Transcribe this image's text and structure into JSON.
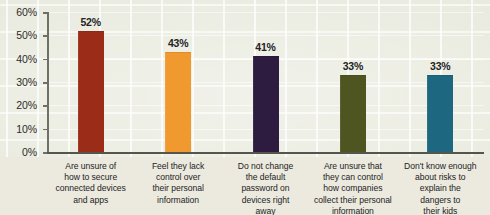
{
  "chart_data": {
    "type": "bar",
    "title": "",
    "xlabel": "",
    "ylabel": "",
    "ylim": [
      0,
      60
    ],
    "ytick_labels": [
      "0%",
      "10%",
      "20%",
      "30%",
      "40%",
      "50%",
      "60%"
    ],
    "ytick_values": [
      0,
      10,
      20,
      30,
      40,
      50,
      60
    ],
    "grid": true,
    "legend": "none",
    "categories": [
      "Are unsure of how to secure connected devices and apps",
      "Feel they lack control over their personal information",
      "Do not change the default password on devices right away",
      "Are unsure that they can control how companies collect their personal information",
      "Don't know enough about risks to explain the dangers to their kids"
    ],
    "values": [
      52,
      43,
      41,
      33,
      33
    ],
    "value_labels": [
      "52%",
      "43%",
      "41%",
      "33%",
      "33%"
    ],
    "colors": [
      "#9b2d18",
      "#f0992e",
      "#2e1b40",
      "#4e5520",
      "#1d6781"
    ],
    "bars": [
      {
        "value_label": "52%",
        "color": "#9b2d18",
        "label_lines": [
          "Are unsure of",
          "how to secure",
          "connected devices",
          "and apps"
        ]
      },
      {
        "value_label": "43%",
        "color": "#f0992e",
        "label_lines": [
          "Feel they lack",
          "control over",
          "their personal",
          "information"
        ]
      },
      {
        "value_label": "41%",
        "color": "#2e1b40",
        "label_lines": [
          "Do not change",
          "the default",
          "password on",
          "devices right",
          "away"
        ]
      },
      {
        "value_label": "33%",
        "color": "#4e5520",
        "label_lines": [
          "Are unsure that",
          "they can control",
          "how companies",
          "collect their personal",
          "information"
        ]
      },
      {
        "value_label": "33%",
        "color": "#1d6781",
        "label_lines": [
          "Don't know enough",
          "about risks to",
          "explain the",
          "dangers to",
          "their kids"
        ]
      }
    ]
  },
  "colors": {
    "background": "#e9eade",
    "axis": "#55554d",
    "text": "#23231f"
  }
}
